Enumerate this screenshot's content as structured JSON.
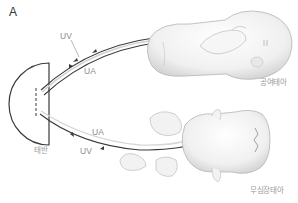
{
  "figure": {
    "panel_label": "A",
    "labels": {
      "placenta": "태반",
      "donor_twin": "공여태아",
      "acardiac_twin": "무심장태아",
      "upper_uv": "UV",
      "upper_ua": "UA",
      "lower_ua": "UA",
      "lower_uv": "UV"
    },
    "colors": {
      "line": "#3a3a3a",
      "label": "#8a8a8a",
      "skin_fill": "#f4f4f4",
      "skin_shade": "#d6d6d6",
      "vessel_light": "#cfcfcf"
    }
  }
}
